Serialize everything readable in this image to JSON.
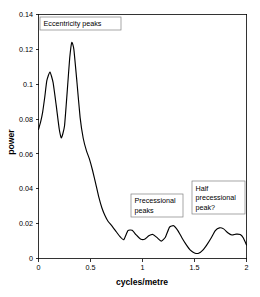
{
  "chart_data": {
    "type": "line",
    "title": "",
    "subtitle": "",
    "xlabel": "cycles/metre",
    "ylabel": "power",
    "xlim": [
      0,
      2
    ],
    "ylim": [
      0,
      0.14
    ],
    "grid": false,
    "legend": null,
    "x_ticks": [
      "0",
      "0.5",
      "1",
      "1.5",
      "2"
    ],
    "x_tick_values": [
      0,
      0.5,
      1,
      1.5,
      2
    ],
    "y_ticks": [
      "0",
      "0.02",
      "0.04",
      "0.06",
      "0.08",
      "0.1",
      "0.12",
      "0.14"
    ],
    "y_tick_values": [
      0,
      0.02,
      0.04,
      0.06,
      0.08,
      0.1,
      0.12,
      0.14
    ],
    "line_color": "#000000",
    "series": [
      {
        "name": "power spectrum",
        "x": [
          0.0,
          0.02,
          0.04,
          0.06,
          0.08,
          0.11,
          0.14,
          0.17,
          0.2,
          0.22,
          0.25,
          0.28,
          0.3,
          0.32,
          0.34,
          0.37,
          0.4,
          0.43,
          0.46,
          0.49,
          0.52,
          0.55,
          0.58,
          0.61,
          0.64,
          0.67,
          0.7,
          0.74,
          0.78,
          0.82,
          0.86,
          0.9,
          0.94,
          0.98,
          1.02,
          1.06,
          1.1,
          1.14,
          1.18,
          1.22,
          1.26,
          1.3,
          1.34,
          1.38,
          1.42,
          1.46,
          1.5,
          1.54,
          1.58,
          1.62,
          1.66,
          1.7,
          1.74,
          1.78,
          1.82,
          1.86,
          1.9,
          1.94,
          1.97,
          2.0
        ],
        "y": [
          0.074,
          0.0782,
          0.084,
          0.0925,
          0.102,
          0.107,
          0.101,
          0.088,
          0.074,
          0.0692,
          0.076,
          0.099,
          0.115,
          0.124,
          0.12,
          0.101,
          0.081,
          0.069,
          0.062,
          0.057,
          0.0505,
          0.043,
          0.0352,
          0.029,
          0.0245,
          0.0212,
          0.0192,
          0.016,
          0.0128,
          0.0108,
          0.016,
          0.0162,
          0.0135,
          0.0112,
          0.011,
          0.013,
          0.0138,
          0.012,
          0.01,
          0.0122,
          0.018,
          0.0188,
          0.016,
          0.0118,
          0.008,
          0.0048,
          0.0032,
          0.003,
          0.0048,
          0.008,
          0.0118,
          0.016,
          0.0176,
          0.017,
          0.0148,
          0.0135,
          0.014,
          0.0138,
          0.0118,
          0.0078
        ]
      }
    ],
    "annotations": [
      {
        "id": "eccentricity-peaks",
        "lines": [
          "Eccentricity peaks"
        ],
        "x_data": 0.12,
        "y_data": 0.136,
        "box": {
          "x": 40,
          "y": 17,
          "width": 81,
          "height": 13
        }
      },
      {
        "id": "precessional-peaks",
        "lines": [
          "Precessional",
          "peaks"
        ],
        "x_data": 0.94,
        "y_data": 0.033,
        "box": {
          "x": 131,
          "y": 194,
          "width": 52,
          "height": 23
        }
      },
      {
        "id": "half-precessional-peak",
        "lines": [
          "Half",
          "precessional",
          "peak?"
        ],
        "x_data": 1.6,
        "y_data": 0.042,
        "box": {
          "x": 192,
          "y": 181,
          "width": 53,
          "height": 33
        }
      }
    ],
    "peaks": [
      {
        "label": "eccentricity peak 1",
        "x": 0.11,
        "y": 0.107
      },
      {
        "label": "eccentricity peak 2",
        "x": 0.32,
        "y": 0.124
      },
      {
        "label": "precessional peak 1",
        "x": 0.86,
        "y": 0.0165
      },
      {
        "label": "precessional peak 2",
        "x": 1.08,
        "y": 0.0138
      },
      {
        "label": "precessional peak 3",
        "x": 1.27,
        "y": 0.019
      },
      {
        "label": "half precessional peak",
        "x": 1.74,
        "y": 0.0177
      }
    ],
    "minima": [
      {
        "x": 0.22,
        "y": 0.0692
      },
      {
        "x": 0.8,
        "y": 0.0105
      },
      {
        "x": 1.5,
        "y": 0.003
      }
    ]
  }
}
